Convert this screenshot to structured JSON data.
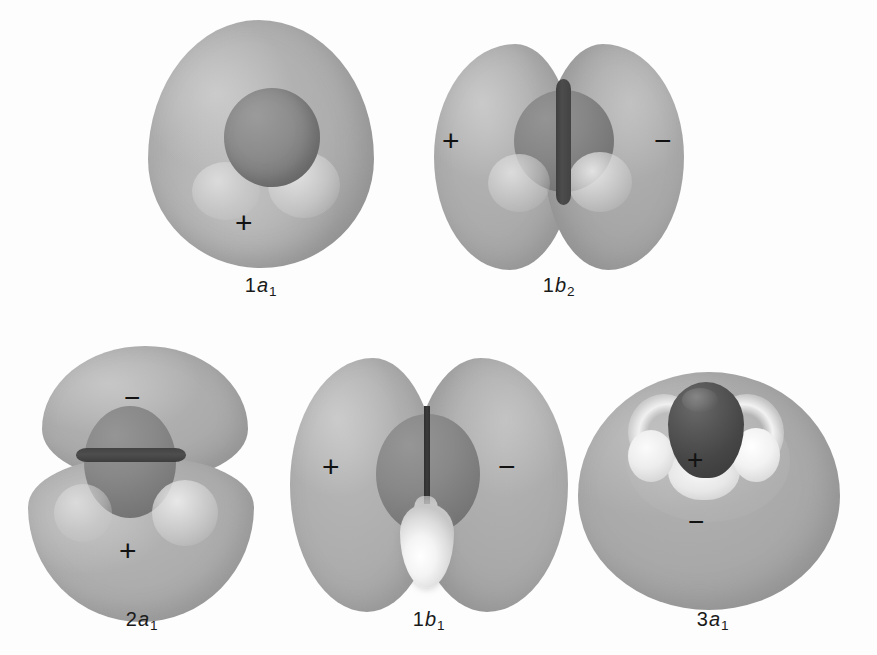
{
  "figure": {
    "background_color": "#fdfdfd",
    "lobe_color": "#a9a9a9",
    "oxygen_color": "#7c7c7c",
    "node_color": "#434343",
    "hydrogen_color": "#f2f2f2",
    "sign_color": "#121212"
  },
  "orbitals": [
    {
      "id": "1a1",
      "label_number": "1",
      "label_symmetry": "a",
      "label_subscript": "1",
      "row": 1,
      "column": 1,
      "signs": [
        {
          "symbol": "+",
          "position": "bottom-center"
        }
      ],
      "node_count": 0,
      "node_type": "none",
      "description": "Single large ovoid lobe enclosing the oxygen core sphere"
    },
    {
      "id": "1b2",
      "label_number": "1",
      "label_symmetry": "b",
      "label_subscript": "2",
      "row": 1,
      "column": 2,
      "signs": [
        {
          "symbol": "+",
          "position": "left"
        },
        {
          "symbol": "−",
          "position": "right"
        }
      ],
      "node_count": 1,
      "node_type": "vertical",
      "description": "Two lobes separated by a vertical nodal plane through the oxygen"
    },
    {
      "id": "2a1",
      "label_number": "2",
      "label_symmetry": "a",
      "label_subscript": "1",
      "row": 2,
      "column": 1,
      "signs": [
        {
          "symbol": "−",
          "position": "top"
        },
        {
          "symbol": "+",
          "position": "bottom"
        }
      ],
      "node_count": 1,
      "node_type": "horizontal",
      "description": "Upper and lower lobes separated by a horizontal nodal plane"
    },
    {
      "id": "1b1",
      "label_number": "1",
      "label_symmetry": "b",
      "label_subscript": "1",
      "row": 2,
      "column": 2,
      "signs": [
        {
          "symbol": "+",
          "position": "left"
        },
        {
          "symbol": "−",
          "position": "right"
        }
      ],
      "node_count": 1,
      "node_type": "vertical",
      "description": "Two tall lobes split by a thin vertical node, white hydrogen protruding below"
    },
    {
      "id": "3a1",
      "label_number": "3",
      "label_symmetry": "a",
      "label_subscript": "1",
      "row": 2,
      "column": 3,
      "signs": [
        {
          "symbol": "+",
          "position": "center-upper"
        },
        {
          "symbol": "−",
          "position": "center-lower"
        }
      ],
      "node_count": 1,
      "node_type": "enclosing",
      "description": "Large outer lobe enclosing an inner region around the dark oxygen and white hydrogens"
    }
  ]
}
